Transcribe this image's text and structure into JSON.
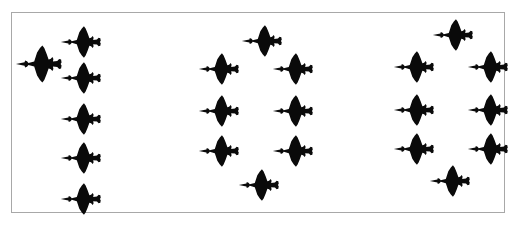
{
  "scene": {
    "title": "Jet fighter formation silhouettes",
    "background_color": "#ffffff",
    "frame_border_color": "#a8a8a8",
    "silhouette_color": "#0a0a0a",
    "aircraft_total": 22,
    "heading": "left",
    "icon_name": "delta-wing-jet-icon"
  },
  "groups": [
    {
      "name": "left-formation",
      "label": "Left formation",
      "count": 6,
      "pattern": "leader plus trailing column",
      "aircraft": [
        {
          "id": "L1",
          "role": "leader",
          "x": 14,
          "y": 43,
          "w": 48,
          "h": 40
        },
        {
          "id": "L2",
          "role": "wingman",
          "x": 59,
          "y": 24,
          "w": 42,
          "h": 34
        },
        {
          "id": "L3",
          "role": "wingman",
          "x": 59,
          "y": 60,
          "w": 42,
          "h": 34
        },
        {
          "id": "L4",
          "role": "wingman",
          "x": 59,
          "y": 101,
          "w": 42,
          "h": 34
        },
        {
          "id": "L5",
          "role": "wingman",
          "x": 59,
          "y": 140,
          "w": 42,
          "h": 34
        },
        {
          "id": "L6",
          "role": "wingman",
          "x": 59,
          "y": 181,
          "w": 42,
          "h": 34
        }
      ]
    },
    {
      "name": "center-formation",
      "label": "Center formation",
      "count": 8,
      "pattern": "diamond",
      "aircraft": [
        {
          "id": "C1",
          "role": "leader",
          "x": 240,
          "y": 23,
          "w": 42,
          "h": 34
        },
        {
          "id": "C2",
          "role": "left-column",
          "x": 197,
          "y": 51,
          "w": 42,
          "h": 34
        },
        {
          "id": "C3",
          "role": "right-column",
          "x": 271,
          "y": 51,
          "w": 42,
          "h": 34
        },
        {
          "id": "C4",
          "role": "left-column",
          "x": 197,
          "y": 93,
          "w": 42,
          "h": 34
        },
        {
          "id": "C5",
          "role": "right-column",
          "x": 271,
          "y": 93,
          "w": 42,
          "h": 34
        },
        {
          "id": "C6",
          "role": "left-column",
          "x": 197,
          "y": 133,
          "w": 42,
          "h": 34
        },
        {
          "id": "C7",
          "role": "right-column",
          "x": 271,
          "y": 133,
          "w": 42,
          "h": 34
        },
        {
          "id": "C8",
          "role": "slot",
          "x": 237,
          "y": 167,
          "w": 42,
          "h": 34
        }
      ]
    },
    {
      "name": "right-formation",
      "label": "Right formation",
      "count": 8,
      "pattern": "diamond",
      "aircraft": [
        {
          "id": "R1",
          "role": "leader",
          "x": 431,
          "y": 17,
          "w": 42,
          "h": 34
        },
        {
          "id": "R2",
          "role": "left-column",
          "x": 392,
          "y": 49,
          "w": 42,
          "h": 34
        },
        {
          "id": "R3",
          "role": "right-column",
          "x": 466,
          "y": 49,
          "w": 42,
          "h": 34
        },
        {
          "id": "R4",
          "role": "left-column",
          "x": 392,
          "y": 92,
          "w": 42,
          "h": 34
        },
        {
          "id": "R5",
          "role": "right-column",
          "x": 466,
          "y": 92,
          "w": 42,
          "h": 34
        },
        {
          "id": "R6",
          "role": "left-column",
          "x": 392,
          "y": 131,
          "w": 42,
          "h": 34
        },
        {
          "id": "R7",
          "role": "right-column",
          "x": 466,
          "y": 131,
          "w": 42,
          "h": 34
        },
        {
          "id": "R8",
          "role": "slot",
          "x": 428,
          "y": 163,
          "w": 42,
          "h": 34
        }
      ]
    }
  ]
}
